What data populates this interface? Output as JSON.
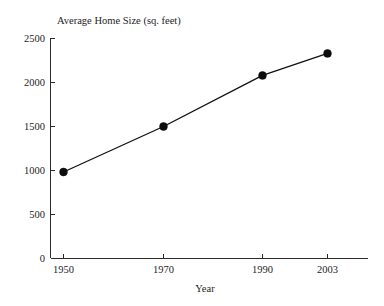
{
  "chart_data": {
    "type": "line",
    "title": "Average Home Size (sq. feet)",
    "xlabel": "Year",
    "ylabel": "",
    "categories": [
      "1950",
      "1970",
      "1990",
      "2003"
    ],
    "values": [
      983,
      1500,
      2080,
      2330
    ],
    "series": [
      {
        "name": "Average Home Size",
        "values": [
          983,
          1500,
          2080,
          2330
        ]
      }
    ],
    "ylim": [
      0,
      2500
    ],
    "y_ticks": [
      "0",
      "500",
      "1000",
      "1500",
      "2000",
      "2500"
    ],
    "y_tick_values": [
      0,
      500,
      1000,
      1500,
      2000,
      2500
    ],
    "x_ticks": [
      "1950",
      "1970",
      "1990",
      "2003"
    ],
    "grid": false,
    "legend": false,
    "legend_position": "none",
    "marker": "filled-circle",
    "line_color": "#111111",
    "marker_color": "#0d0d0d",
    "background_color": "#ffffff",
    "axis_color": "#2b2b2b"
  },
  "labels": {
    "title": "Average Home Size (sq. feet)",
    "x_axis_title": "Year",
    "y_tick_0": "0",
    "y_tick_1": "500",
    "y_tick_2": "1000",
    "y_tick_3": "1500",
    "y_tick_4": "2000",
    "y_tick_5": "2500",
    "x_tick_0": "1950",
    "x_tick_1": "1970",
    "x_tick_2": "1990",
    "x_tick_3": "2003"
  }
}
